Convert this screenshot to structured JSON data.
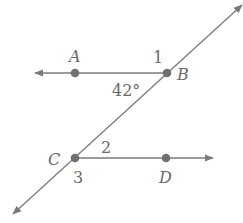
{
  "diagram": {
    "points": [
      {
        "id": "A",
        "label": "A",
        "x": 75,
        "y": 73
      },
      {
        "id": "B",
        "label": "B",
        "x": 167,
        "y": 73
      },
      {
        "id": "C",
        "label": "C",
        "x": 75,
        "y": 158
      },
      {
        "id": "D",
        "label": "D",
        "x": 166,
        "y": 158
      }
    ],
    "angle_labels": {
      "one": "1",
      "two": "2",
      "three": "3",
      "measure": "42°"
    },
    "colors": {
      "line": "#7a7a7a",
      "point": "#707070",
      "text": "#6a6a6a"
    }
  }
}
